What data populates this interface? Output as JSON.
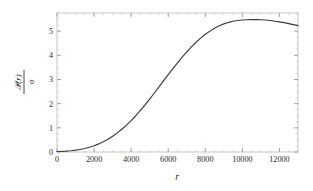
{
  "chart_data": {
    "type": "line",
    "title": "",
    "subtitle": "",
    "xlabel": "r",
    "ylabel_numerator": "𝒫(r)",
    "ylabel_denominator": "σ",
    "ylabel": "𝒫(r)/σ",
    "xlim": [
      0,
      13000
    ],
    "ylim": [
      0,
      5.75
    ],
    "x_ticks": [
      0,
      2000,
      4000,
      6000,
      8000,
      10000,
      12000
    ],
    "x_tick_labels": [
      "0",
      "2000",
      "4000",
      "6000",
      "8000",
      "10000",
      "12000"
    ],
    "y_ticks": [
      0,
      1,
      2,
      3,
      4,
      5
    ],
    "y_tick_labels": [
      "0",
      "1",
      "2",
      "3",
      "4",
      "5"
    ],
    "x_minor_interval": 500,
    "y_minor_interval": 0.25,
    "grid": false,
    "legend": null,
    "legend_position": "none",
    "frame": true,
    "series": [
      {
        "name": "P(r)/sigma",
        "color": "#3a3a3a",
        "x": [
          0,
          250,
          500,
          750,
          1000,
          1250,
          1500,
          1750,
          2000,
          2250,
          2500,
          2750,
          3000,
          3250,
          3500,
          3750,
          4000,
          4250,
          4500,
          4750,
          5000,
          5250,
          5500,
          5750,
          6000,
          6250,
          6500,
          6750,
          7000,
          7250,
          7500,
          7750,
          8000,
          8250,
          8500,
          8750,
          9000,
          9250,
          9500,
          9750,
          10000,
          10250,
          10500,
          10750,
          11000,
          11250,
          11500,
          11750,
          12000,
          12250,
          12500,
          12750,
          13000
        ],
        "y": [
          0.02,
          0.025,
          0.035,
          0.05,
          0.075,
          0.105,
          0.145,
          0.195,
          0.26,
          0.335,
          0.425,
          0.53,
          0.65,
          0.79,
          0.94,
          1.11,
          1.3,
          1.5,
          1.72,
          1.95,
          2.19,
          2.44,
          2.69,
          2.95,
          3.2,
          3.45,
          3.69,
          3.92,
          4.14,
          4.35,
          4.54,
          4.71,
          4.87,
          5.0,
          5.12,
          5.22,
          5.3,
          5.36,
          5.41,
          5.44,
          5.46,
          5.47,
          5.475,
          5.475,
          5.47,
          5.46,
          5.44,
          5.41,
          5.38,
          5.35,
          5.31,
          5.27,
          5.23
        ]
      }
    ]
  },
  "figure": {
    "background_color": "#ffffff",
    "frame_color": "#b9b9b9",
    "curve_color": "#3a3a3a",
    "text_color": "#1d1d1d"
  }
}
